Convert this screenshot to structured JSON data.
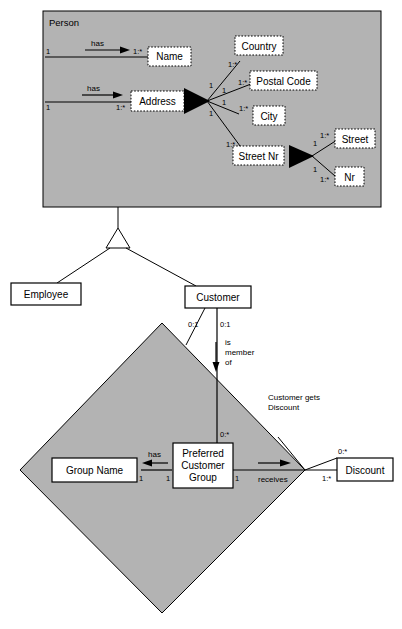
{
  "diagram": {
    "type": "uml-class-diagram",
    "colors": {
      "package_fill": "#b3b3b3",
      "diamond_fill": "#b3b3b3",
      "entity_fill": "#ffffff",
      "attribute_fill": "#ffffff",
      "line": "#000000",
      "background": "#ffffff"
    }
  },
  "package": {
    "name": "Person",
    "title_label": "Person"
  },
  "entities": [
    {
      "id": "person",
      "label": "Person"
    },
    {
      "id": "employee",
      "label": "Employee"
    },
    {
      "id": "customer",
      "label": "Customer"
    },
    {
      "id": "group_name",
      "label": "Group Name"
    },
    {
      "id": "pcg",
      "label_line1": "Preferred",
      "label_line2": "Customer",
      "label_line3": "Group"
    },
    {
      "id": "discount",
      "label": "Discount"
    }
  ],
  "attributes": [
    {
      "id": "name",
      "label": "Name"
    },
    {
      "id": "address",
      "label": "Address"
    },
    {
      "id": "country",
      "label": "Country"
    },
    {
      "id": "postal_code",
      "label": "Postal Code"
    },
    {
      "id": "city",
      "label": "City"
    },
    {
      "id": "street_nr",
      "label": "Street Nr"
    },
    {
      "id": "street",
      "label": "Street"
    },
    {
      "id": "nr",
      "label": "Nr"
    }
  ],
  "verbs": {
    "has_name": "has",
    "has_address": "has",
    "has_group_name": "has",
    "receives": "receives",
    "is_member_of_line1": "is",
    "is_member_of_line2": "member",
    "is_member_of_line3": "of"
  },
  "notes": {
    "customer_gets_discount_line1": "Customer gets",
    "customer_gets_discount_line2": "Discount"
  },
  "multiplicities": {
    "person_name_src": "1",
    "person_name_tgt": "1:*",
    "person_address_src": "1",
    "person_address_tgt": "1:*",
    "address_country_src": "1",
    "address_country_tgt": "1:*",
    "address_postal_src": "1",
    "address_postal_tgt": "1:*",
    "address_city_src": "1",
    "address_city_tgt": "1:*",
    "address_streetnr_src": "1",
    "address_streetnr_tgt": "1:*",
    "streetnr_street_src": "1",
    "streetnr_street_tgt": "1:*",
    "streetnr_nr_src": "1",
    "streetnr_nr_tgt": "1:*",
    "customer_left": "0:1",
    "customer_right": "0:1",
    "pcg_top": "0:*",
    "groupname_right": "1",
    "pcg_left": "1",
    "pcg_right": "1",
    "discount_top": "0:*",
    "discount_left": "1:*"
  }
}
